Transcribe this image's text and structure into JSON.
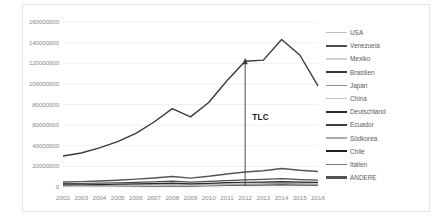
{
  "chart_data": {
    "type": "line",
    "title": "",
    "xlabel": "",
    "ylabel": "",
    "categories": [
      "2002",
      "2003",
      "2004",
      "2005",
      "2006",
      "2007",
      "2008",
      "2009",
      "2010",
      "2011",
      "2012",
      "2013",
      "2014",
      "2015",
      "2016"
    ],
    "ylim": [
      0,
      160000000
    ],
    "yticks": [
      0,
      20000000,
      40000000,
      60000000,
      80000000,
      100000000,
      120000000,
      140000000,
      160000000
    ],
    "ytick_labels": [
      "0",
      "20000000",
      "40000000",
      "60000000",
      "80000000",
      "100000000",
      "120000000",
      "140000000",
      "160000000"
    ],
    "grid": true,
    "legend_position": "right",
    "series": [
      {
        "name": "USA",
        "color": "#bfbfbf",
        "width": 1.0,
        "values": [
          1600000,
          1800000,
          2000000,
          2300000,
          2600000,
          2900000,
          3400000,
          2600000,
          3200000,
          3900000,
          4300000,
          4600000,
          5200000,
          4600000,
          4300000
        ]
      },
      {
        "name": "Venezuela",
        "color": "#4d4d4d",
        "width": 1.2,
        "values": [
          3200000,
          3400000,
          3700000,
          4100000,
          4500000,
          5000000,
          5600000,
          4700000,
          5400000,
          6200000,
          6900000,
          7400000,
          8100000,
          7200000,
          6600000
        ]
      },
      {
        "name": "Mexiko",
        "color": "#d0d0d0",
        "width": 1.0,
        "values": [
          900000,
          1000000,
          1100000,
          1300000,
          1500000,
          1700000,
          2000000,
          1600000,
          1900000,
          2300000,
          2700000,
          3000000,
          3400000,
          3000000,
          2800000
        ]
      },
      {
        "name": "Brasilien",
        "color": "#3a3a3a",
        "width": 1.4,
        "values": [
          30000000,
          33000000,
          38000000,
          44000000,
          52000000,
          63000000,
          76000000,
          68000000,
          82000000,
          103000000,
          122000000,
          123000000,
          143000000,
          128000000,
          98000000
        ]
      },
      {
        "name": "Japan",
        "color": "#909090",
        "width": 1.0,
        "values": [
          1200000,
          1300000,
          1400000,
          1600000,
          1800000,
          2000000,
          2300000,
          1900000,
          2200000,
          2600000,
          2900000,
          3100000,
          3500000,
          3100000,
          2900000
        ]
      },
      {
        "name": "China",
        "color": "#c8c8c8",
        "width": 1.0,
        "values": [
          400000,
          500000,
          600000,
          800000,
          1000000,
          1400000,
          1800000,
          1700000,
          2200000,
          2900000,
          3500000,
          3900000,
          4500000,
          4100000,
          3900000
        ]
      },
      {
        "name": "Deutschland",
        "color": "#2b2b2b",
        "width": 1.2,
        "values": [
          2100000,
          2200000,
          2400000,
          2700000,
          3000000,
          3300000,
          3800000,
          3000000,
          3600000,
          4200000,
          4600000,
          4800000,
          5300000,
          4700000,
          4400000
        ]
      },
      {
        "name": "Ecuador",
        "color": "#404040",
        "width": 1.2,
        "values": [
          700000,
          800000,
          900000,
          1000000,
          1200000,
          1400000,
          1600000,
          1300000,
          1600000,
          1900000,
          2200000,
          2400000,
          2700000,
          2400000,
          2200000
        ]
      },
      {
        "name": "Südkorea",
        "color": "#a8a8a8",
        "width": 1.0,
        "values": [
          600000,
          700000,
          800000,
          900000,
          1100000,
          1300000,
          1500000,
          1200000,
          1500000,
          1800000,
          2100000,
          2300000,
          2600000,
          2300000,
          2100000
        ]
      },
      {
        "name": "Chile",
        "color": "#1f1f1f",
        "width": 1.2,
        "values": [
          500000,
          600000,
          700000,
          800000,
          900000,
          1100000,
          1300000,
          1100000,
          1300000,
          1600000,
          1800000,
          2000000,
          2200000,
          2000000,
          1900000
        ]
      },
      {
        "name": "Italien",
        "color": "#7a7a7a",
        "width": 1.0,
        "values": [
          800000,
          900000,
          1000000,
          1100000,
          1300000,
          1500000,
          1700000,
          1400000,
          1700000,
          2000000,
          2300000,
          2500000,
          2800000,
          2500000,
          2300000
        ]
      },
      {
        "name": "ANDERE",
        "color": "#555555",
        "width": 1.4,
        "values": [
          4800000,
          5200000,
          5800000,
          6600000,
          7600000,
          8800000,
          10200000,
          8600000,
          10400000,
          12600000,
          14600000,
          15800000,
          18000000,
          16200000,
          15000000
        ]
      }
    ],
    "annotations": [
      {
        "label": "TLC",
        "at_category": "2012",
        "arrow": "up"
      }
    ]
  }
}
